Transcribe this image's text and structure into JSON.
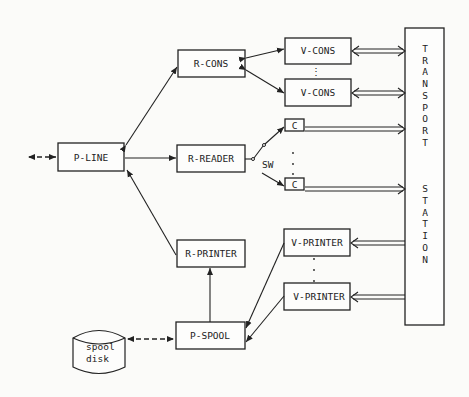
{
  "diagram": {
    "nodes": {
      "p_line": "P-LINE",
      "r_cons": "R-CONS",
      "r_reader": "R-READER",
      "r_printer": "R-PRINTER",
      "p_spool": "P-SPOOL",
      "v_cons_1": "V-CONS",
      "v_cons_2": "V-CONS",
      "c_1": "C",
      "c_2": "C",
      "v_printer_1": "V-PRINTER",
      "v_printer_2": "V-PRINTER",
      "transport_station": [
        "T",
        "R",
        "A",
        "N",
        "S",
        "P",
        "O",
        "R",
        "T",
        "",
        "S",
        "T",
        "A",
        "T",
        "I",
        "O",
        "N"
      ],
      "spool_disk_line1": "spool",
      "spool_disk_line2": "disk"
    },
    "switch_label": "SW",
    "ellipsis": "⋮"
  }
}
